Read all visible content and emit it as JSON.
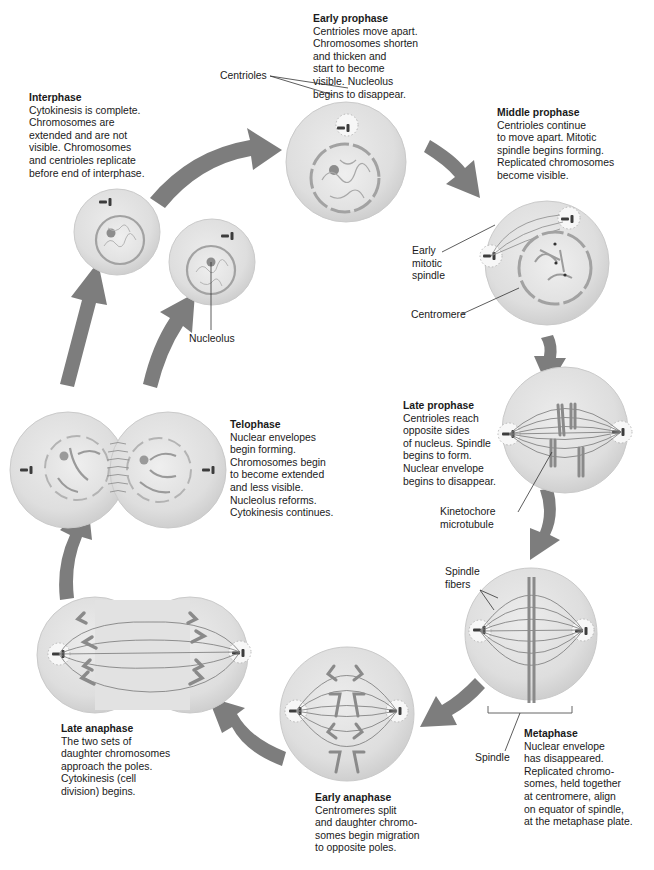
{
  "figure": {
    "topic": "Stages of mitosis (cell cycle)",
    "colors": {
      "arrow": "#7d7d7d",
      "cell_fill": "#dcdcdc",
      "cell_edge": "#c4c4c4",
      "nucleus_fill": "#e9e9e9",
      "envelope": "#9a9a9a",
      "chromosome": "#8c8c8c",
      "spindle": "#6e6e6e",
      "centriole": "#3c3c3c",
      "text": "#1a1a1a"
    }
  },
  "phases": {
    "interphase": {
      "title": "Interphase",
      "lines": [
        "Cytokinesis is complete.",
        "Chromosomes are",
        "extended and are not",
        "visible. Chromosomes",
        "and centrioles replicate",
        "before end of interphase."
      ]
    },
    "early_prophase": {
      "title": "Early prophase",
      "lines": [
        "Centrioles move apart.",
        "Chromosomes shorten",
        "and thicken and",
        "start to become",
        "visible. Nucleolus",
        "begins to disappear."
      ]
    },
    "middle_prophase": {
      "title": "Middle prophase",
      "lines": [
        "Centrioles continue",
        "to move apart. Mitotic",
        "spindle begins forming.",
        "Replicated chromosomes",
        "become visible."
      ]
    },
    "late_prophase": {
      "title": "Late prophase",
      "lines": [
        "Centrioles reach",
        "opposite sides",
        "of nucleus. Spindle",
        "begins to form.",
        "Nuclear envelope",
        "begins to disappear."
      ]
    },
    "metaphase": {
      "title": "Metaphase",
      "lines": [
        "Nuclear envelope",
        "has disappeared.",
        "Replicated chromo-",
        "somes, held together",
        "at centromere, align",
        "on equator of spindle,",
        "at the metaphase plate."
      ]
    },
    "early_anaphase": {
      "title": "Early anaphase",
      "lines": [
        "Centromeres split",
        "and daughter chromo-",
        "somes begin migration",
        "to opposite poles."
      ]
    },
    "late_anaphase": {
      "title": "Late anaphase",
      "lines": [
        "The two sets of",
        "daughter chromosomes",
        "approach the poles.",
        "Cytokinesis (cell",
        "division) begins."
      ]
    },
    "telophase": {
      "title": "Telophase",
      "lines": [
        "Nuclear envelopes",
        "begin forming.",
        "Chromosomes begin",
        "to become extended",
        "and less visible.",
        "Nucleolus reforms.",
        "Cytokinesis continues."
      ]
    }
  },
  "labels": {
    "centrioles": [
      "Centrioles"
    ],
    "nucleolus": [
      "Nucleolus"
    ],
    "early_mitotic_spindle": [
      "Early",
      "mitotic",
      "spindle"
    ],
    "centromere": [
      "Centromere"
    ],
    "kinetochore_microtubule": [
      "Kinetochore",
      "microtubule"
    ],
    "spindle_fibers": [
      "Spindle",
      "fibers"
    ],
    "spindle": [
      "Spindle"
    ]
  }
}
